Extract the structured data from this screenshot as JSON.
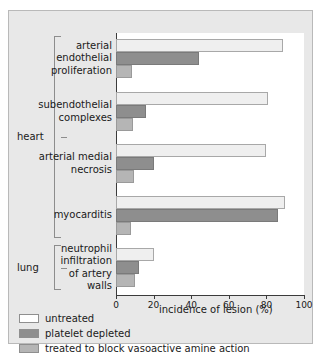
{
  "chart_data": {
    "type": "bar",
    "orientation": "horizontal",
    "title": "",
    "xlabel": "incidence of lesion (%)",
    "ylabel": "",
    "xlim": [
      0,
      100
    ],
    "xticks": [
      0,
      20,
      40,
      60,
      80,
      100
    ],
    "grid": false,
    "legend_position": "bottom-left",
    "categories": [
      "arterial\nendothelial\nproliferation",
      "subendothelial\ncomplexes",
      "arterial medial\nnecrosis",
      "myocarditis",
      "neutrophil\ninfiltration\nof artery\nwalls"
    ],
    "groups": [
      {
        "label": "heart",
        "categories": [
          0,
          1,
          2,
          3
        ]
      },
      {
        "label": "lung",
        "categories": [
          4
        ]
      }
    ],
    "series": [
      {
        "name": "untreated",
        "color": "#efefef",
        "values": [
          89,
          81,
          80,
          90,
          20
        ]
      },
      {
        "name": "platelet depleted",
        "color": "#8e8e8e",
        "values": [
          44,
          16,
          20,
          86,
          12
        ]
      },
      {
        "name": "treated to block vasoactive amine action",
        "color": "#b5b5b5",
        "values": [
          8.5,
          9,
          9.5,
          8,
          10
        ]
      }
    ]
  },
  "legend": {
    "items": [
      {
        "label": "untreated",
        "swatch": "#ffffff"
      },
      {
        "label": "platelet depleted",
        "swatch": "#8e8e8e"
      },
      {
        "label": "treated to block vasoactive amine action",
        "swatch": "#b5b5b5"
      }
    ]
  }
}
